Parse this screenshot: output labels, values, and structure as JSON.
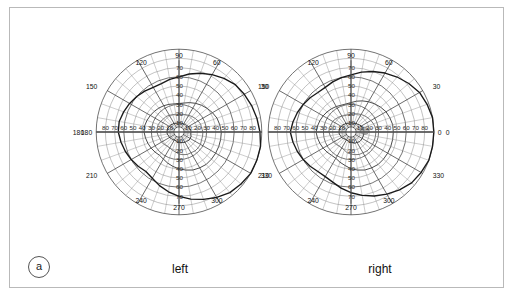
{
  "figure": {
    "panel_label": "a",
    "frame_color": "#b9b9b9",
    "background": "#ffffff"
  },
  "labels": {
    "left_eye": "left",
    "right_eye": "right"
  },
  "chart_data": {
    "type": "scatter",
    "title": "",
    "subtitle": "",
    "xlabel": "",
    "ylabel": "",
    "plot_kind": "binocular-visual-field-perimetry",
    "grid": true,
    "legend_position": "none",
    "panels": [
      {
        "name": "left",
        "eye_label": "left",
        "center_px": [
          178,
          131
        ],
        "meridian_labels": [
          "0",
          "30",
          "60",
          "90",
          "120",
          "150",
          "180",
          "210",
          "240",
          "270",
          "300",
          "330"
        ],
        "meridian_labels_shown": [
          "120",
          "90",
          "60",
          "150",
          "30",
          "180",
          "0",
          "210",
          "330",
          "240",
          "270",
          "300"
        ],
        "eccentricity_ticks": [
          10,
          20,
          30,
          40,
          50,
          60,
          70,
          80,
          90
        ],
        "horizontal_tick_labels_left": [
          "80",
          "70",
          "60",
          "50",
          "40",
          "30",
          "20",
          "10"
        ],
        "horizontal_tick_labels_right": [
          "10",
          "20",
          "30",
          "40",
          "50",
          "60",
          "70",
          "80"
        ],
        "vertical_tick_labels_up": [
          "10",
          "20",
          "30",
          "40",
          "50",
          "60",
          "70"
        ],
        "vertical_tick_labels_down": [
          "10",
          "20",
          "30",
          "40",
          "50",
          "60",
          "70"
        ],
        "radial_max_deg": 90,
        "isopters": [
          {
            "name": "outer-boundary",
            "color": "#1a1a1a",
            "radii_deg": [
              88,
              86,
              84,
              82,
              80,
              76,
              72,
              68,
              64,
              60,
              58,
              56,
              56,
              58,
              60,
              62,
              64,
              66,
              66,
              64,
              62,
              60,
              58,
              56,
              58,
              62,
              66,
              70,
              74,
              78,
              82,
              86,
              88,
              90,
              90,
              90
            ],
            "angles_deg": [
              0,
              10,
              20,
              30,
              40,
              50,
              60,
              70,
              80,
              90,
              100,
              110,
              120,
              130,
              140,
              150,
              160,
              170,
              180,
              190,
              200,
              210,
              220,
              230,
              240,
              250,
              260,
              270,
              280,
              290,
              300,
              310,
              320,
              330,
              340,
              350
            ]
          },
          {
            "name": "mid-isopter",
            "color": "#4a4a4a",
            "radii_deg": [
              46,
              45,
              44,
              42,
              40,
              38,
              36,
              34,
              32,
              31,
              31,
              32,
              33,
              34,
              35,
              36,
              37,
              38,
              38,
              37,
              36,
              35,
              34,
              33,
              34,
              36,
              38,
              40,
              42,
              44,
              45,
              46,
              46,
              46,
              46,
              46
            ],
            "angles_deg": [
              0,
              10,
              20,
              30,
              40,
              50,
              60,
              70,
              80,
              90,
              100,
              110,
              120,
              130,
              140,
              150,
              160,
              170,
              180,
              190,
              200,
              210,
              220,
              230,
              240,
              250,
              260,
              270,
              280,
              290,
              300,
              310,
              320,
              330,
              340,
              350
            ]
          },
          {
            "name": "inner-isopter",
            "color": "#6a6a6a",
            "radii_deg": [
              26,
              25,
              25,
              24,
              23,
              22,
              21,
              20,
              19,
              19,
              19,
              20,
              21,
              22,
              22,
              23,
              24,
              24,
              24,
              23,
              22,
              22,
              21,
              20,
              20,
              21,
              22,
              24,
              25,
              26,
              26,
              27,
              27,
              27,
              26,
              26
            ],
            "angles_deg": [
              0,
              10,
              20,
              30,
              40,
              50,
              60,
              70,
              80,
              90,
              100,
              110,
              120,
              130,
              140,
              150,
              160,
              170,
              180,
              190,
              200,
              210,
              220,
              230,
              240,
              250,
              260,
              270,
              280,
              290,
              300,
              310,
              320,
              330,
              340,
              350
            ]
          },
          {
            "name": "central-isopter",
            "color": "#2a2a2a",
            "radii_deg": [
              13,
              13,
              12,
              12,
              11,
              11,
              10,
              10,
              10,
              10,
              10,
              10,
              11,
              11,
              12,
              12,
              13,
              13,
              13,
              13,
              12,
              12,
              11,
              11,
              10,
              10,
              11,
              11,
              12,
              12,
              13,
              13,
              14,
              14,
              14,
              13
            ],
            "angles_deg": [
              0,
              10,
              20,
              30,
              40,
              50,
              60,
              70,
              80,
              90,
              100,
              110,
              120,
              130,
              140,
              150,
              160,
              170,
              180,
              190,
              200,
              210,
              220,
              230,
              240,
              250,
              260,
              270,
              280,
              290,
              300,
              310,
              320,
              330,
              340,
              350
            ]
          }
        ],
        "blind_spot": {
          "present": false,
          "angle_deg": 180,
          "eccentricity_deg": 15,
          "color": "#8a8a8a"
        }
      },
      {
        "name": "right",
        "eye_label": "right",
        "center_px": [
          350,
          131
        ],
        "meridian_labels_shown": [
          "120",
          "90",
          "60",
          "150",
          "30",
          "180",
          "0",
          "210",
          "330",
          "240",
          "270",
          "300"
        ],
        "eccentricity_ticks": [
          10,
          20,
          30,
          40,
          50,
          60,
          70,
          80,
          90
        ],
        "horizontal_tick_labels_left": [
          "80",
          "70",
          "60",
          "50",
          "40",
          "30",
          "20",
          "10"
        ],
        "horizontal_tick_labels_right": [
          "10",
          "20",
          "30",
          "40",
          "50",
          "60",
          "70",
          "80"
        ],
        "vertical_tick_labels_up": [
          "10",
          "20",
          "30",
          "40",
          "50",
          "60",
          "70"
        ],
        "vertical_tick_labels_down": [
          "10",
          "20",
          "30",
          "40",
          "50",
          "60",
          "70"
        ],
        "radial_max_deg": 90,
        "isopters": [
          {
            "name": "outer-boundary",
            "color": "#1a1a1a",
            "radii_deg": [
              90,
              90,
              88,
              86,
              82,
              78,
              74,
              70,
              66,
              62,
              60,
              58,
              56,
              56,
              58,
              60,
              62,
              64,
              66,
              64,
              62,
              60,
              58,
              56,
              56,
              58,
              62,
              66,
              70,
              74,
              78,
              82,
              86,
              88,
              90,
              90
            ],
            "angles_deg": [
              0,
              10,
              20,
              30,
              40,
              50,
              60,
              70,
              80,
              90,
              100,
              110,
              120,
              130,
              140,
              150,
              160,
              170,
              180,
              190,
              200,
              210,
              220,
              230,
              240,
              250,
              260,
              270,
              280,
              290,
              300,
              310,
              320,
              330,
              340,
              350
            ]
          },
          {
            "name": "mid-isopter",
            "color": "#4a4a4a",
            "radii_deg": [
              46,
              46,
              45,
              44,
              42,
              40,
              38,
              36,
              34,
              32,
              31,
              31,
              32,
              33,
              34,
              35,
              36,
              37,
              38,
              37,
              36,
              35,
              34,
              33,
              33,
              35,
              37,
              40,
              42,
              44,
              45,
              46,
              46,
              46,
              46,
              46
            ],
            "angles_deg": [
              0,
              10,
              20,
              30,
              40,
              50,
              60,
              70,
              80,
              90,
              100,
              110,
              120,
              130,
              140,
              150,
              160,
              170,
              180,
              190,
              200,
              210,
              220,
              230,
              240,
              250,
              260,
              270,
              280,
              290,
              300,
              310,
              320,
              330,
              340,
              350
            ]
          },
          {
            "name": "inner-isopter",
            "color": "#6a6a6a",
            "radii_deg": [
              27,
              27,
              26,
              25,
              24,
              23,
              22,
              21,
              20,
              19,
              19,
              19,
              20,
              21,
              22,
              23,
              23,
              24,
              24,
              23,
              22,
              22,
              21,
              20,
              20,
              21,
              23,
              24,
              25,
              26,
              26,
              27,
              27,
              27,
              27,
              27
            ],
            "angles_deg": [
              0,
              10,
              20,
              30,
              40,
              50,
              60,
              70,
              80,
              90,
              100,
              110,
              120,
              130,
              140,
              150,
              160,
              170,
              180,
              190,
              200,
              210,
              220,
              230,
              240,
              250,
              260,
              270,
              280,
              290,
              300,
              310,
              320,
              330,
              340,
              350
            ]
          },
          {
            "name": "central-isopter",
            "color": "#2a2a2a",
            "radii_deg": [
              14,
              14,
              13,
              13,
              12,
              11,
              11,
              10,
              10,
              10,
              10,
              10,
              11,
              11,
              12,
              12,
              13,
              13,
              13,
              13,
              12,
              12,
              11,
              10,
              10,
              10,
              11,
              11,
              12,
              13,
              13,
              14,
              14,
              14,
              14,
              14
            ],
            "angles_deg": [
              0,
              10,
              20,
              30,
              40,
              50,
              60,
              70,
              80,
              90,
              100,
              110,
              120,
              130,
              140,
              150,
              160,
              170,
              180,
              190,
              200,
              210,
              220,
              230,
              240,
              250,
              260,
              270,
              280,
              290,
              300,
              310,
              320,
              330,
              340,
              350
            ]
          }
        ],
        "blind_spot": {
          "present": true,
          "angle_deg": 5,
          "eccentricity_deg": 15,
          "color": "#8f8f8f"
        }
      }
    ]
  }
}
